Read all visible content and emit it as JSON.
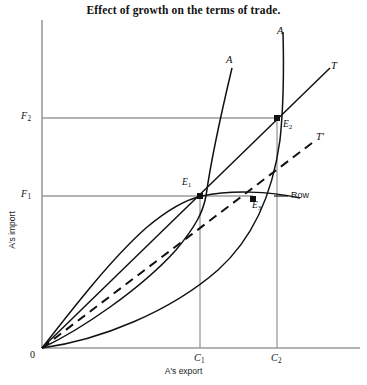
{
  "figure": {
    "title": "Effect of growth on the terms of trade.",
    "xlabel": "A's export",
    "ylabel": "A's import",
    "origin_label": "0"
  },
  "ticks": {
    "y": [
      {
        "name": "F2",
        "base": "F",
        "sub": "2",
        "value_px_y": 118
      },
      {
        "name": "F1",
        "base": "F",
        "sub": "1",
        "value_px_y": 196
      }
    ],
    "x": [
      {
        "name": "C1",
        "base": "C",
        "sub": "1",
        "value_px_x": 200
      },
      {
        "name": "C2",
        "base": "C",
        "sub": "2",
        "value_px_x": 277
      }
    ]
  },
  "curve_labels": {
    "a_first": "A",
    "a_second": "A",
    "t_solid": "T",
    "t_dashed": "T",
    "t_dashed_prime": "'",
    "row": "Row"
  },
  "points": [
    {
      "name": "E1",
      "base": "E",
      "sub": "1",
      "x": 200,
      "y": 196
    },
    {
      "name": "E2",
      "base": "E",
      "sub": "2",
      "x": 277,
      "y": 118
    },
    {
      "name": "E3",
      "base": "E",
      "sub": "3",
      "x": 253,
      "y": 199
    }
  ],
  "chart_data": {
    "type": "line",
    "title": "Effect of growth on the terms of trade.",
    "xlabel": "A's export",
    "ylabel": "A's import",
    "grid": "equilibrium guide lines only",
    "legend": "inline curve labels",
    "axis_origin": {
      "x": 42,
      "y": 348
    },
    "axis_extent": {
      "x_max": 360,
      "y_min": 20
    },
    "series": [
      {
        "name": "A",
        "role": "original offer curve of country A",
        "style": "solid",
        "label": "A",
        "label_pos": {
          "x": 226,
          "y": 60
        },
        "path": "M 42 348 C 80 330 140 290 176 250 C 196 226 203 212 206 196 C 211 160 222 110 232 68"
      },
      {
        "name": "A-grown",
        "role": "offer curve of country A after growth",
        "style": "solid",
        "label": "A",
        "label_pos": {
          "x": 277,
          "y": 38
        },
        "path": "M 42 348 C 100 340 170 312 218 270 C 258 234 274 184 280 140 C 283 112 284 70 283 32"
      },
      {
        "name": "Row",
        "role": "rest of world offer curve",
        "style": "solid",
        "label": "Row",
        "label_pos": {
          "x": 291,
          "y": 196
        },
        "path": "M 42 348 C 70 312 110 260 146 228 C 172 206 188 199 202 196 C 230 190 268 191 300 198"
      },
      {
        "name": "T",
        "role": "original terms of trade ray through E1 and E2",
        "style": "solid-straight",
        "label": "T",
        "label_pos": {
          "x": 331,
          "y": 68
        },
        "path": "M 42 348 L 330 68"
      },
      {
        "name": "T-prime",
        "role": "new terms of trade ray through E3",
        "style": "dashed-straight",
        "label": "T'",
        "label_pos": {
          "x": 317,
          "y": 139
        },
        "path": "M 42 348 L 312 143"
      }
    ],
    "equilibria": [
      {
        "label": "E1",
        "x_tick": "C1",
        "y_tick": "F1",
        "note": "initial equilibrium"
      },
      {
        "label": "E2",
        "x_tick": "C2",
        "y_tick": "F2",
        "note": "equilibrium after growth, unchanged terms of trade"
      },
      {
        "label": "E3",
        "x_tick": null,
        "y_tick": null,
        "note": "equilibrium after growth with worsened terms of trade"
      }
    ]
  }
}
